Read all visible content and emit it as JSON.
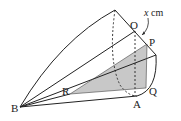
{
  "diagram": {
    "type": "cone-geometry",
    "points": {
      "top": {
        "x": 115,
        "y": 10
      },
      "O": {
        "label": "O",
        "x": 135,
        "y": 31
      },
      "P": {
        "label": "P",
        "x": 147,
        "y": 44
      },
      "right": {
        "x": 156,
        "y": 55
      },
      "Q": {
        "label": "Q",
        "x": 146,
        "y": 88
      },
      "A": {
        "label": "A",
        "x": 137,
        "y": 96
      },
      "B": {
        "label": "B",
        "x": 20,
        "y": 107
      },
      "R": {
        "label": "R",
        "x": 70,
        "y": 94
      }
    },
    "labels": {
      "O": "O",
      "P": "P",
      "Q": "Q",
      "A": "A",
      "B": "B",
      "R": "R",
      "dimension": "x cm",
      "dimension_var": "x",
      "dimension_unit": "cm"
    },
    "colors": {
      "line": "#222222",
      "shade": "#c8c8c8"
    }
  }
}
